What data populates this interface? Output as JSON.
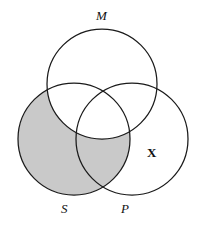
{
  "figure": {
    "type": "venn-diagram",
    "background_color": "#ffffff",
    "stroke_color": "#1a1a1a",
    "shade_color": "#c9c9c9"
  },
  "labels": {
    "middle_term": "M",
    "subject_term": "S",
    "predicate_term": "P",
    "existential_marker": "X"
  },
  "circles": [
    {
      "id": "M",
      "label": "M",
      "cx": 102,
      "cy": 84,
      "r": 55
    },
    {
      "id": "S",
      "label": "S",
      "cx": 74,
      "cy": 139,
      "r": 56
    },
    {
      "id": "P",
      "label": "P",
      "cx": 132,
      "cy": 139,
      "r": 56
    }
  ],
  "shaded_regions": [
    {
      "id": "S-not-M",
      "description": "S minus M",
      "color": "#c9c9c9"
    }
  ],
  "markers": [
    {
      "id": "X",
      "symbol": "X",
      "region": "P-only",
      "x": 152,
      "y": 152,
      "bold": true
    }
  ]
}
